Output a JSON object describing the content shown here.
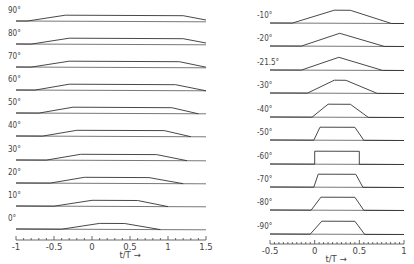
{
  "chart_data": [
    {
      "type": "line",
      "title": "",
      "xlabel": "t/T →",
      "ylabel": "",
      "xlim": [
        -1,
        1.5
      ],
      "x_ticks": [
        -1,
        -0.5,
        0,
        0.5,
        1,
        1.5
      ],
      "x_tick_labels": [
        "-1",
        "-0.5",
        "0",
        "0.5",
        "1",
        "1.5"
      ],
      "grid": false,
      "series": [
        {
          "name": "90°",
          "points": [
            [
              -1,
              0
            ],
            [
              -0.85,
              0
            ],
            [
              -0.35,
              1
            ],
            [
              1.2,
              1
            ],
            [
              1.5,
              0.3
            ]
          ]
        },
        {
          "name": "80°",
          "points": [
            [
              -1,
              0
            ],
            [
              -0.8,
              0
            ],
            [
              -0.3,
              1
            ],
            [
              1.2,
              1
            ],
            [
              1.5,
              0.3
            ]
          ]
        },
        {
          "name": "70°",
          "points": [
            [
              -1,
              0
            ],
            [
              -0.8,
              0
            ],
            [
              -0.3,
              1
            ],
            [
              1.15,
              1
            ],
            [
              1.5,
              0.1
            ]
          ]
        },
        {
          "name": "60°",
          "points": [
            [
              -1,
              0
            ],
            [
              -0.75,
              0
            ],
            [
              -0.3,
              1
            ],
            [
              1.1,
              1
            ],
            [
              1.5,
              0
            ]
          ]
        },
        {
          "name": "50°",
          "points": [
            [
              -1,
              0
            ],
            [
              -0.7,
              0
            ],
            [
              -0.25,
              1
            ],
            [
              1.05,
              1
            ],
            [
              1.4,
              0
            ]
          ]
        },
        {
          "name": "40°",
          "points": [
            [
              -1,
              0
            ],
            [
              -0.65,
              0
            ],
            [
              -0.2,
              1
            ],
            [
              0.95,
              1
            ],
            [
              1.3,
              0
            ]
          ]
        },
        {
          "name": "30°",
          "points": [
            [
              -1,
              0
            ],
            [
              -0.6,
              0
            ],
            [
              -0.15,
              1
            ],
            [
              0.85,
              1
            ],
            [
              1.25,
              0
            ]
          ]
        },
        {
          "name": "20°",
          "points": [
            [
              -1,
              0
            ],
            [
              -0.55,
              0
            ],
            [
              -0.1,
              1
            ],
            [
              0.75,
              1
            ],
            [
              1.2,
              0
            ]
          ]
        },
        {
          "name": "10°",
          "points": [
            [
              -1,
              0
            ],
            [
              -0.5,
              0
            ],
            [
              0.0,
              1
            ],
            [
              0.6,
              1
            ],
            [
              1.0,
              0
            ]
          ]
        },
        {
          "name": "0°",
          "points": [
            [
              -1,
              0
            ],
            [
              -0.4,
              0
            ],
            [
              0.1,
              1
            ],
            [
              0.43,
              1
            ],
            [
              0.9,
              0
            ]
          ]
        }
      ]
    },
    {
      "type": "line",
      "title": "",
      "xlabel": "t/T →",
      "ylabel": "",
      "xlim": [
        -0.5,
        1
      ],
      "x_ticks": [
        -0.5,
        0,
        0.5,
        1
      ],
      "x_tick_labels": [
        "-0.5",
        "0",
        "0.5",
        "1"
      ],
      "grid": false,
      "series": [
        {
          "name": "-10°",
          "points": [
            [
              -0.5,
              0
            ],
            [
              -0.25,
              0
            ],
            [
              0.22,
              1
            ],
            [
              0.4,
              1
            ],
            [
              0.86,
              0
            ],
            [
              1,
              0
            ]
          ]
        },
        {
          "name": "-20°",
          "points": [
            [
              -0.5,
              0
            ],
            [
              -0.15,
              0
            ],
            [
              0.28,
              1
            ],
            [
              0.28,
              1
            ],
            [
              0.78,
              0
            ],
            [
              1,
              0
            ]
          ]
        },
        {
          "name": "-21.5°",
          "points": [
            [
              -0.5,
              0
            ],
            [
              -0.15,
              0
            ],
            [
              0.27,
              1
            ],
            [
              0.27,
              1
            ],
            [
              0.76,
              0
            ],
            [
              1,
              0
            ]
          ]
        },
        {
          "name": "-30°",
          "points": [
            [
              -0.5,
              0
            ],
            [
              -0.08,
              0
            ],
            [
              0.22,
              1
            ],
            [
              0.35,
              1
            ],
            [
              0.7,
              0
            ],
            [
              1,
              0
            ]
          ]
        },
        {
          "name": "-40°",
          "points": [
            [
              -0.5,
              0
            ],
            [
              -0.03,
              0
            ],
            [
              0.15,
              1
            ],
            [
              0.4,
              1
            ],
            [
              0.6,
              0
            ],
            [
              1,
              0
            ]
          ]
        },
        {
          "name": "-50°",
          "points": [
            [
              -0.5,
              0
            ],
            [
              -0.01,
              0
            ],
            [
              0.06,
              1
            ],
            [
              0.45,
              1
            ],
            [
              0.55,
              0
            ],
            [
              1,
              0
            ]
          ]
        },
        {
          "name": "-60°",
          "points": [
            [
              -0.5,
              0
            ],
            [
              0.0,
              0
            ],
            [
              0.0,
              1
            ],
            [
              0.5,
              1
            ],
            [
              0.5,
              0
            ],
            [
              1,
              0
            ]
          ]
        },
        {
          "name": "-70°",
          "points": [
            [
              -0.5,
              0
            ],
            [
              -0.01,
              0
            ],
            [
              0.04,
              1
            ],
            [
              0.46,
              1
            ],
            [
              0.54,
              0
            ],
            [
              1,
              0
            ]
          ]
        },
        {
          "name": "-80°",
          "points": [
            [
              -0.5,
              0
            ],
            [
              -0.04,
              0
            ],
            [
              0.07,
              1
            ],
            [
              0.45,
              1
            ],
            [
              0.55,
              0
            ],
            [
              1,
              0
            ]
          ]
        },
        {
          "name": "-90°",
          "points": [
            [
              -0.5,
              0
            ],
            [
              -0.05,
              0
            ],
            [
              0.08,
              1
            ],
            [
              0.45,
              1
            ],
            [
              0.56,
              0
            ],
            [
              1,
              0
            ]
          ]
        }
      ]
    }
  ],
  "left_panel": {
    "row_labels": [
      "90°",
      "80°",
      "70°",
      "60°",
      "50°",
      "40°",
      "30°",
      "20°",
      "10°",
      "0°"
    ],
    "axis_label": "t/T →",
    "tick_labels": [
      "-1",
      "-0.5",
      "0",
      "0.5",
      "1",
      "1.5"
    ]
  },
  "right_panel": {
    "row_labels": [
      "-10°",
      "-20°",
      "-21.5°",
      "-30°",
      "-40°",
      "-50°",
      "-60°",
      "-70°",
      "-80°",
      "-90°"
    ],
    "axis_label": "t/T →",
    "tick_labels": [
      "-0.5",
      "0",
      "0.5",
      "1"
    ]
  }
}
